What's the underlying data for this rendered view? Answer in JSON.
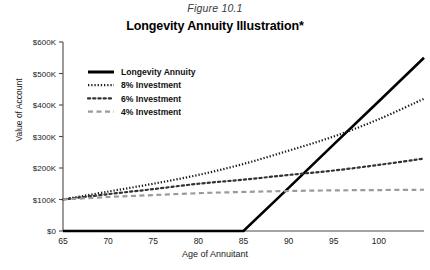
{
  "figure": {
    "caption": "Figure 10.1",
    "title": "Longevity Annuity Illustration*"
  },
  "axes": {
    "ylabel": "Value of Account",
    "xlabel": "Age of Annuitant",
    "yticks": [
      "$0",
      "$100K",
      "$200K",
      "$300K",
      "$400K",
      "$500K",
      "$600K"
    ],
    "xticks": [
      "65",
      "70",
      "75",
      "80",
      "85",
      "90",
      "95",
      "100"
    ]
  },
  "legend": {
    "items": [
      {
        "label": "Longevity Annuity",
        "style": "solid",
        "color": "#000000"
      },
      {
        "label": "8% Investment",
        "style": "fine-dotted",
        "color": "#1a1a1a"
      },
      {
        "label": "6% Investment",
        "style": "dotted",
        "color": "#333333"
      },
      {
        "label": "4% Investment",
        "style": "dashed",
        "color": "#9a9a9a"
      }
    ]
  },
  "colors": {
    "annuity": "#000000",
    "eight": "#1a1a1a",
    "six": "#333333",
    "four": "#9a9a9a",
    "axis": "#4a4a4a"
  },
  "chart_data": {
    "type": "line",
    "title": "Longevity Annuity Illustration*",
    "xlabel": "Age of Annuitant",
    "ylabel": "Value of Account",
    "xlim": [
      65,
      105
    ],
    "ylim": [
      0,
      600000
    ],
    "xticks": [
      65,
      70,
      75,
      80,
      85,
      90,
      95,
      100
    ],
    "yticks": [
      0,
      100000,
      200000,
      300000,
      400000,
      500000,
      600000
    ],
    "grid": false,
    "legend_position": "upper-left-inside",
    "series": [
      {
        "name": "Longevity Annuity",
        "style": "solid",
        "x": [
          65,
          70,
          75,
          80,
          85,
          90,
          95,
          100,
          105
        ],
        "values": [
          0,
          0,
          0,
          0,
          0,
          137000,
          275000,
          412000,
          550000
        ]
      },
      {
        "name": "8% Investment",
        "style": "fine-dotted",
        "x": [
          65,
          70,
          75,
          80,
          85,
          90,
          95,
          100,
          105
        ],
        "values": [
          100000,
          125000,
          150000,
          178000,
          213000,
          255000,
          300000,
          355000,
          420000
        ]
      },
      {
        "name": "6% Investment",
        "style": "dotted",
        "x": [
          65,
          70,
          75,
          80,
          85,
          90,
          95,
          100,
          105
        ],
        "values": [
          100000,
          117000,
          133000,
          150000,
          163000,
          178000,
          192000,
          210000,
          230000
        ]
      },
      {
        "name": "4% Investment",
        "style": "dashed",
        "x": [
          65,
          70,
          75,
          80,
          85,
          90,
          95,
          100,
          105
        ],
        "values": [
          100000,
          108000,
          114000,
          120000,
          124000,
          127000,
          129000,
          130000,
          131000
        ]
      }
    ],
    "annotations": [
      "Annuity payout begins at age 85",
      "Annuity crosses 4% line near age 88.5",
      "Annuity crosses 6% line near age 90",
      "Annuity crosses 8% line near age 93.5"
    ]
  }
}
